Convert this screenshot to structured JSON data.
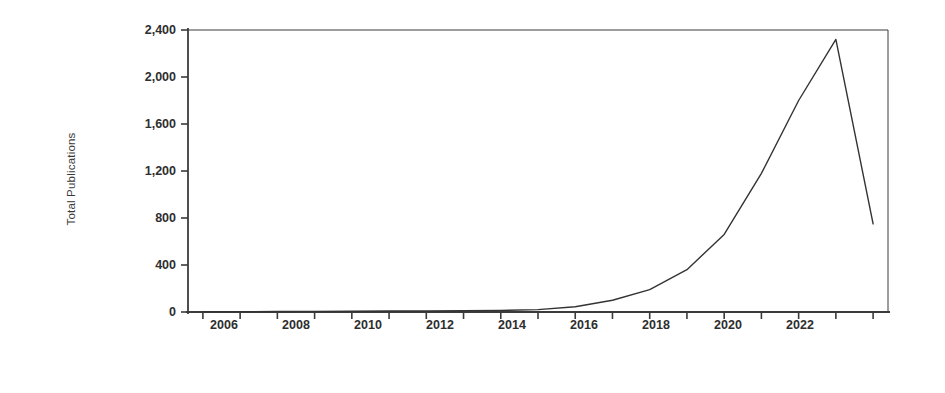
{
  "chart_data": {
    "type": "line",
    "title": "",
    "xlabel": "Years",
    "ylabel": "Total Publications",
    "x": [
      2005,
      2006,
      2007,
      2008,
      2009,
      2010,
      2011,
      2012,
      2013,
      2014,
      2015,
      2016,
      2017,
      2018,
      2019,
      2020,
      2021,
      2022,
      2023
    ],
    "values": [
      2,
      3,
      4,
      5,
      6,
      8,
      9,
      11,
      14,
      20,
      45,
      100,
      190,
      360,
      660,
      1180,
      1800,
      2320,
      750
    ],
    "series": [
      {
        "name": "Total Publications",
        "values": [
          2,
          3,
          4,
          5,
          6,
          8,
          9,
          11,
          14,
          20,
          45,
          100,
          190,
          360,
          660,
          1180,
          1800,
          2320,
          750
        ]
      }
    ],
    "xlim": [
      2004.6,
      2023.4
    ],
    "ylim": [
      0,
      2400
    ],
    "xticks": [
      2006,
      2008,
      2010,
      2012,
      2014,
      2016,
      2018,
      2020,
      2022
    ],
    "xtick_labels": [
      "2006",
      "2008",
      "2010",
      "2012",
      "2014",
      "2016",
      "2018",
      "2020",
      "2022"
    ],
    "xminorticks": [
      2005,
      2007,
      2009,
      2011,
      2013,
      2015,
      2017,
      2019,
      2021,
      2023
    ],
    "yticks": [
      0,
      400,
      800,
      1200,
      1600,
      2000,
      2400
    ],
    "ytick_labels": [
      "0",
      "400",
      "800",
      "1,200",
      "1,600",
      "2,000",
      "2,400"
    ],
    "grid": false,
    "legend": false,
    "line_color": "#333333",
    "axis_color": "#3b3b3b",
    "background": "#ffffff"
  }
}
